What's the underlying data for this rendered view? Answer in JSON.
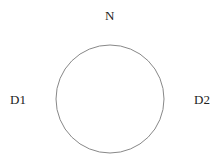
{
  "diagram": {
    "labels": {
      "top": "N",
      "left": "D1",
      "right": "D2"
    },
    "circle": {
      "cx": 110,
      "cy": 99,
      "r": 54,
      "stroke": "#888888"
    }
  }
}
